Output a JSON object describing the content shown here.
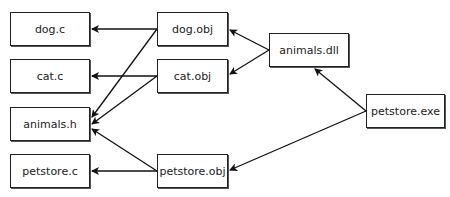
{
  "diagram": {
    "nodes": [
      {
        "id": "dog_c",
        "label": "dog.c",
        "x": 10,
        "y": 12,
        "w": 80,
        "h": 34
      },
      {
        "id": "cat_c",
        "label": "cat.c",
        "x": 10,
        "y": 59,
        "w": 80,
        "h": 34
      },
      {
        "id": "animals_h",
        "label": "animals.h",
        "x": 10,
        "y": 107,
        "w": 80,
        "h": 34
      },
      {
        "id": "petstore_c",
        "label": "petstore.c",
        "x": 10,
        "y": 154,
        "w": 80,
        "h": 34
      },
      {
        "id": "dog_obj",
        "label": "dog.obj",
        "x": 157,
        "y": 12,
        "w": 71,
        "h": 34
      },
      {
        "id": "cat_obj",
        "label": "cat.obj",
        "x": 157,
        "y": 59,
        "w": 71,
        "h": 34
      },
      {
        "id": "petstore_obj",
        "label": "petstore.obj",
        "x": 157,
        "y": 154,
        "w": 71,
        "h": 34
      },
      {
        "id": "animals_dll",
        "label": "animals.dll",
        "x": 269,
        "y": 33,
        "w": 80,
        "h": 34
      },
      {
        "id": "petstore_exe",
        "label": "petstore.exe",
        "x": 366,
        "y": 94,
        "w": 79,
        "h": 34
      }
    ],
    "edges": [
      {
        "from": "dog_obj",
        "to": "dog_c"
      },
      {
        "from": "dog_obj",
        "to": "animals_h"
      },
      {
        "from": "cat_obj",
        "to": "cat_c"
      },
      {
        "from": "cat_obj",
        "to": "animals_h"
      },
      {
        "from": "petstore_obj",
        "to": "petstore_c"
      },
      {
        "from": "petstore_obj",
        "to": "animals_h"
      },
      {
        "from": "animals_dll",
        "to": "dog_obj"
      },
      {
        "from": "animals_dll",
        "to": "cat_obj"
      },
      {
        "from": "petstore_exe",
        "to": "animals_dll"
      },
      {
        "from": "petstore_exe",
        "to": "petstore_obj"
      }
    ]
  }
}
